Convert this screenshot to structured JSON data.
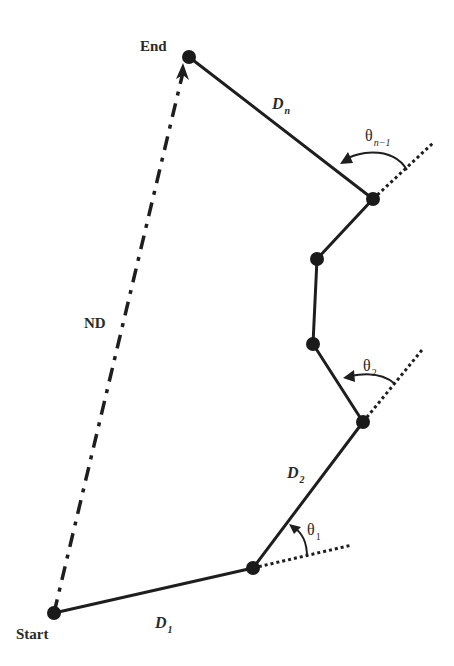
{
  "diagram": {
    "type": "path-trajectory",
    "colors": {
      "line": "#1e1e1e",
      "node": "#1a1a1a",
      "text": "#2a2a2a",
      "background": "#ffffff"
    },
    "labels": {
      "start": "Start",
      "end": "End",
      "net_displacement": "ND",
      "d1_main": "D",
      "d1_sub": "1",
      "d2_main": "D",
      "d2_sub": "2",
      "dn_main": "D",
      "dn_sub": "n",
      "theta1_main": "θ",
      "theta1_sub": "1",
      "theta2_main": "θ",
      "theta2_sub": "2",
      "thetan_main": "θ",
      "thetan_sub": "n−1"
    },
    "nodes": [
      {
        "id": "start",
        "x": 54,
        "y": 613
      },
      {
        "id": "p1",
        "x": 253,
        "y": 568
      },
      {
        "id": "p2",
        "x": 363,
        "y": 422
      },
      {
        "id": "p3",
        "x": 313,
        "y": 344
      },
      {
        "id": "p4",
        "x": 317,
        "y": 259
      },
      {
        "id": "p5",
        "x": 373,
        "y": 199
      },
      {
        "id": "end",
        "x": 189,
        "y": 57
      }
    ]
  }
}
